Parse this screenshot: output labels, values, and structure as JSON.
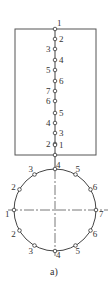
{
  "diagram": {
    "caption": "a)",
    "rect": {
      "x": 15,
      "y": 29,
      "w": 81,
      "h": 126
    },
    "chain": [
      {
        "label": "1",
        "y": 29,
        "side": "top"
      },
      {
        "label": "2",
        "y": 39,
        "side": "right"
      },
      {
        "label": "3",
        "y": 49,
        "side": "left"
      },
      {
        "label": "4",
        "y": 60,
        "side": "right"
      },
      {
        "label": "5",
        "y": 70,
        "side": "left"
      },
      {
        "label": "6",
        "y": 81,
        "side": "right"
      },
      {
        "label": "7",
        "y": 91,
        "side": "left"
      },
      {
        "label": "6",
        "y": 101,
        "side": "left"
      },
      {
        "label": "5",
        "y": 113,
        "side": "right"
      },
      {
        "label": "4",
        "y": 123,
        "side": "left"
      },
      {
        "label": "3",
        "y": 133,
        "side": "right"
      },
      {
        "label": "2",
        "y": 144,
        "side": "left"
      },
      {
        "label": "1",
        "y": 145,
        "side": "right"
      }
    ],
    "circle": {
      "cx": 55,
      "cy": 210,
      "r": 41
    },
    "circle_nodes": [
      {
        "label": "4",
        "angle": 90
      },
      {
        "label": "5",
        "angle": 60
      },
      {
        "label": "6",
        "angle": 30
      },
      {
        "label": "7",
        "angle": 0
      },
      {
        "label": "6",
        "angle": -30
      },
      {
        "label": "5",
        "angle": -60
      },
      {
        "label": "4",
        "angle": -90
      },
      {
        "label": "3",
        "angle": -120
      },
      {
        "label": "2",
        "angle": -150
      },
      {
        "label": "1",
        "angle": 180
      },
      {
        "label": "2",
        "angle": 150
      },
      {
        "label": "3",
        "angle": 120
      }
    ]
  }
}
